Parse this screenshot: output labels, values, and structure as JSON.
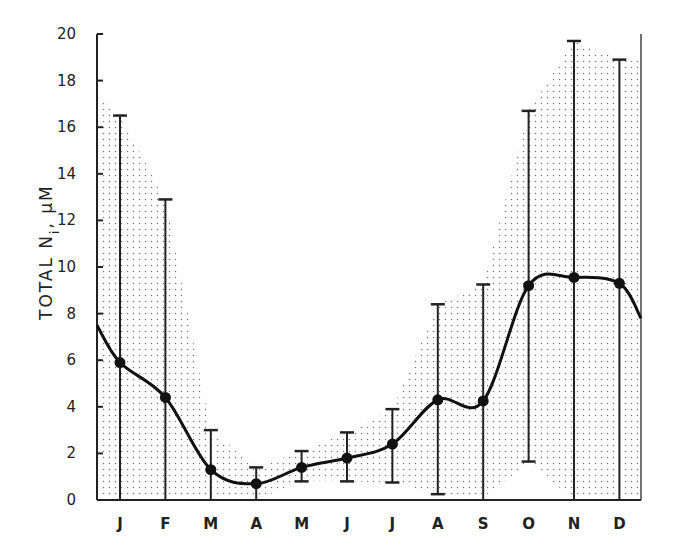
{
  "chart_data": {
    "type": "line",
    "title": "",
    "xlabel": "",
    "ylabel": "TOTAL N",
    "ylabel_subscript": "i",
    "ylabel_unit": ", μM",
    "ylim": [
      0,
      20
    ],
    "yticks": [
      0,
      2,
      4,
      6,
      8,
      10,
      12,
      14,
      16,
      18,
      20
    ],
    "grid": false,
    "legend": null,
    "categories": [
      "J",
      "F",
      "M",
      "A",
      "M",
      "J",
      "J",
      "A",
      "S",
      "O",
      "N",
      "D"
    ],
    "series": [
      {
        "name": "Monthly mean total N_i",
        "values": [
          5.9,
          4.4,
          1.3,
          0.7,
          1.4,
          1.8,
          2.4,
          4.3,
          4.25,
          9.2,
          9.55,
          9.3
        ],
        "error_upper": [
          16.5,
          12.9,
          3.0,
          1.4,
          2.1,
          2.9,
          3.9,
          8.4,
          9.25,
          16.7,
          19.7,
          18.9
        ],
        "error_lower": [
          0.0,
          0.0,
          0.0,
          0.0,
          0.8,
          0.8,
          0.75,
          0.25,
          0.0,
          1.65,
          0.0,
          0.0
        ]
      }
    ],
    "curve_start_value": 7.5,
    "curve_end_value": 7.8,
    "shaded_envelope_note": "stippled region spans the range between error limits across the year",
    "shade_upper": [
      17.4,
      16.5,
      12.9,
      3.0,
      1.4,
      2.1,
      2.9,
      3.9,
      8.4,
      9.25,
      16.7,
      19.7,
      18.9,
      18.9
    ],
    "shade_lower": [
      0,
      0,
      0,
      0,
      0,
      0.8,
      0.8,
      0.75,
      0.25,
      0,
      1.65,
      0,
      0,
      0
    ]
  }
}
